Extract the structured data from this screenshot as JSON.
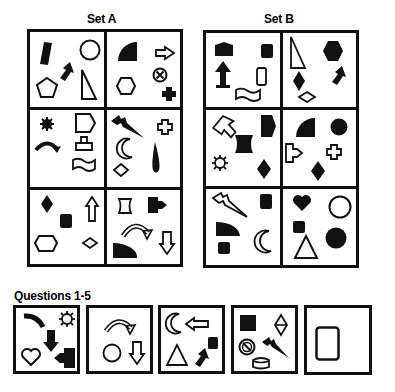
{
  "set_a": {
    "title": "Set A",
    "cells": [
      {
        "position": "row1-col1",
        "shapes": [
          "filled-parallelogram",
          "outline-circle",
          "filled-arrow-up-right",
          "outline-pentagon",
          "outline-right-triangle"
        ]
      },
      {
        "position": "row1-col2",
        "shapes": [
          "filled-quarter-circle",
          "outline-arrow-right",
          "circled-x",
          "outline-hexagon",
          "filled-cross"
        ]
      },
      {
        "position": "row2-col1",
        "shapes": [
          "filled-starburst",
          "outline-pentagon-arrow",
          "filled-curved-arrow",
          "outline-upload-tray",
          "outline-wave-flag"
        ]
      },
      {
        "position": "row2-col2",
        "shapes": [
          "filled-lightning",
          "outline-cross",
          "outline-crescent-moon",
          "filled-teardrop",
          "outline-diamond"
        ]
      },
      {
        "position": "row3-col1",
        "shapes": [
          "filled-diamond",
          "outline-arrow-up",
          "filled-rounded-square",
          "outline-hexagon-wide",
          "outline-diamond"
        ]
      },
      {
        "position": "row3-col2",
        "shapes": [
          "outline-scroll",
          "filled-arrow-tab",
          "outline-curved-arrow",
          "filled-quarter-circle",
          "outline-arrow-down"
        ]
      }
    ]
  },
  "set_b": {
    "title": "Set B",
    "cells": [
      {
        "position": "row1-col1",
        "shapes": [
          "filled-house",
          "filled-rounded-square",
          "filled-arrow-up",
          "outline-rounded-rectangle",
          "outline-wave-flag"
        ]
      },
      {
        "position": "row1-col2",
        "shapes": [
          "outline-right-triangle",
          "filled-hexagon",
          "filled-diamond",
          "filled-arrow-up-right",
          "outline-diamond"
        ]
      },
      {
        "position": "row2-col1",
        "shapes": [
          "outline-arrow-up-left",
          "filled-pentagon-arrow",
          "filled-scroll",
          "outline-starburst",
          "filled-diamond"
        ]
      },
      {
        "position": "row2-col2",
        "shapes": [
          "filled-quarter-circle",
          "filled-circle",
          "outline-arrow-tab",
          "outline-cross",
          "filled-diamond"
        ]
      },
      {
        "position": "row3-col1",
        "shapes": [
          "outline-lightning",
          "filled-rounded-square",
          "filled-quarter-circle",
          "outline-crescent-moon",
          "filled-rounded-square"
        ]
      },
      {
        "position": "row3-col2",
        "shapes": [
          "filled-heart",
          "outline-circle",
          "filled-rounded-square",
          "filled-circle",
          "outline-triangle"
        ]
      }
    ]
  },
  "questions": {
    "title": "Questions 1-5",
    "items": [
      {
        "number": 1,
        "shapes": [
          "filled-curved-bar",
          "outline-starburst",
          "filled-arrow-down",
          "outline-heart",
          "filled-arrow-tab-left"
        ]
      },
      {
        "number": 2,
        "shapes": [
          "outline-curved-arrow",
          "outline-circle",
          "outline-arrow-down"
        ]
      },
      {
        "number": 3,
        "shapes": [
          "outline-crescent-moon",
          "outline-arrow-left",
          "filled-rounded-square",
          "outline-triangle",
          "filled-arrow-up-right"
        ]
      },
      {
        "number": 4,
        "shapes": [
          "filled-square",
          "outline-split-diamond",
          "circled-slash",
          "filled-lightning",
          "outline-cylinder"
        ]
      },
      {
        "number": 5,
        "shapes": [
          "outline-rounded-rectangle"
        ]
      }
    ]
  }
}
